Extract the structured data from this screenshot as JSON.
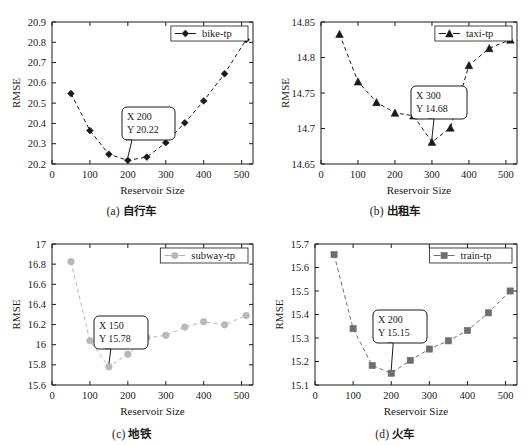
{
  "figure": {
    "panel_count": 4,
    "background": "#ffffff"
  },
  "chart_data": [
    {
      "type": "line",
      "panel": "a",
      "caption_index": "(a)",
      "caption_label": "自行车",
      "title": "",
      "xlabel": "Reservoir Size",
      "ylabel": "RMSE",
      "xlim": [
        0,
        530
      ],
      "ylim": [
        20.2,
        20.9
      ],
      "xticks": [
        0,
        100,
        200,
        300,
        400,
        500
      ],
      "yticks": [
        "20.2",
        "20.3",
        "20.4",
        "20.5",
        "20.6",
        "20.7",
        "20.8",
        "20.9"
      ],
      "grid": false,
      "legend_position": "top-right",
      "series": [
        {
          "name": "bike-tp",
          "marker": "diamond",
          "color": "#1a1a1a",
          "linestyle": "dashed",
          "x": [
            50,
            100,
            150,
            200,
            250,
            300,
            350,
            400,
            455,
            512
          ],
          "values": [
            20.547,
            20.365,
            20.248,
            20.218,
            20.234,
            20.305,
            20.403,
            20.511,
            20.645,
            20.813
          ]
        }
      ],
      "annotation": {
        "label_x": "X 200",
        "label_y": "Y 20.22",
        "point_x": 200,
        "point_y": 20.218
      }
    },
    {
      "type": "line",
      "panel": "b",
      "caption_index": "(b)",
      "caption_label": "出租车",
      "title": "",
      "xlabel": "Reservoir Size",
      "ylabel": "RMSE",
      "xlim": [
        0,
        530
      ],
      "ylim": [
        14.65,
        14.85
      ],
      "xticks": [
        0,
        100,
        200,
        300,
        400,
        500
      ],
      "yticks": [
        "14.65",
        "14.7",
        "14.75",
        "14.8",
        "14.85"
      ],
      "grid": false,
      "legend_position": "top-right",
      "series": [
        {
          "name": "taxi-tp",
          "marker": "triangle",
          "color": "#1a1a1a",
          "linestyle": "dashed",
          "x": [
            50,
            100,
            150,
            200,
            250,
            300,
            350,
            400,
            455,
            512
          ],
          "values": [
            14.833,
            14.766,
            14.737,
            14.722,
            14.718,
            14.681,
            14.701,
            14.789,
            14.813,
            14.825
          ]
        }
      ],
      "annotation": {
        "label_x": "X 300",
        "label_y": "Y 14.68",
        "point_x": 300,
        "point_y": 14.681
      }
    },
    {
      "type": "line",
      "panel": "c",
      "caption_index": "(c)",
      "caption_label": "地铁",
      "title": "",
      "xlabel": "Reservoir Size",
      "ylabel": "RMSE",
      "xlim": [
        0,
        530
      ],
      "ylim": [
        15.6,
        17.0
      ],
      "xticks": [
        0,
        100,
        200,
        300,
        400,
        500
      ],
      "yticks": [
        "15.6",
        "15.8",
        "16",
        "16.2",
        "16.4",
        "16.6",
        "16.8",
        "17"
      ],
      "grid": false,
      "legend_position": "top-right",
      "series": [
        {
          "name": "subway-tp",
          "marker": "circle",
          "color": "#b8b8b8",
          "linestyle": "dashed",
          "x": [
            50,
            100,
            150,
            200,
            250,
            300,
            350,
            400,
            455,
            512
          ],
          "values": [
            16.825,
            16.04,
            15.78,
            15.905,
            16.068,
            16.093,
            16.175,
            16.228,
            16.197,
            16.29
          ]
        }
      ],
      "annotation": {
        "label_x": "X 150",
        "label_y": "Y 15.78",
        "point_x": 150,
        "point_y": 15.78
      }
    },
    {
      "type": "line",
      "panel": "d",
      "caption_index": "(d)",
      "caption_label": "火车",
      "title": "",
      "xlabel": "Reservoir Size",
      "ylabel": "RMSE",
      "xlim": [
        0,
        530
      ],
      "ylim": [
        15.1,
        15.7
      ],
      "xticks": [
        0,
        100,
        200,
        300,
        400,
        500
      ],
      "yticks": [
        "15.1",
        "15.2",
        "15.3",
        "15.4",
        "15.5",
        "15.6",
        "15.7"
      ],
      "grid": false,
      "legend_position": "top-right",
      "series": [
        {
          "name": "train-tp",
          "marker": "square",
          "color": "#6e6e6e",
          "linestyle": "dashed",
          "x": [
            50,
            100,
            150,
            200,
            250,
            300,
            350,
            400,
            455,
            512
          ],
          "values": [
            15.655,
            15.34,
            15.183,
            15.15,
            15.205,
            15.253,
            15.288,
            15.332,
            15.407,
            15.5
          ]
        }
      ],
      "annotation": {
        "label_x": "X 200",
        "label_y": "Y 15.15",
        "point_x": 200,
        "point_y": 15.15
      }
    }
  ]
}
